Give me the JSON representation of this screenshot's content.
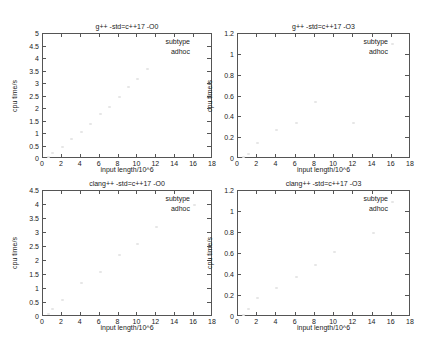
{
  "chart_data": [
    {
      "type": "scatter",
      "title": "g++ -std=c++17 -O0",
      "xlabel": "input length/10^6",
      "ylabel": "cpu time/s",
      "xlim": [
        0,
        18
      ],
      "ylim": [
        0,
        5
      ],
      "xticks": [
        "0",
        "2",
        "4",
        "6",
        "8",
        "10",
        "12",
        "14",
        "16",
        "18"
      ],
      "yticks": [
        "0",
        "0.5",
        "1",
        "1.5",
        "2",
        "2.5",
        "3",
        "3.5",
        "4",
        "4.5",
        "5"
      ],
      "legend": {
        "title": "subtype",
        "entries": [
          "adhoc"
        ],
        "position": "top-right"
      },
      "grid": false,
      "series": [
        {
          "name": "adhoc",
          "x": [
            0.5,
            1,
            2,
            3,
            4,
            5,
            6,
            7,
            8,
            9,
            10,
            11
          ],
          "y": [
            0.1,
            0.25,
            0.5,
            0.8,
            1.1,
            1.4,
            1.8,
            2.1,
            2.5,
            2.9,
            3.2,
            3.6
          ]
        }
      ]
    },
    {
      "type": "scatter",
      "title": "g++ -std=c++17 -O3",
      "xlabel": "input length/10^6",
      "ylabel": "cpu time/s",
      "xlim": [
        0,
        18
      ],
      "ylim": [
        0,
        1.2
      ],
      "xticks": [
        "0",
        "2",
        "4",
        "6",
        "8",
        "10",
        "12",
        "14",
        "16",
        "18"
      ],
      "yticks": [
        "0",
        "0.2",
        "0.4",
        "0.6",
        "0.8",
        "1",
        "1.2"
      ],
      "legend": {
        "title": "subtype",
        "entries": [
          "adhoc"
        ],
        "position": "top-right"
      },
      "grid": false,
      "series": [
        {
          "name": "adhoc",
          "x": [
            0.5,
            1,
            2,
            4,
            6,
            8,
            12,
            16
          ],
          "y": [
            0.02,
            0.05,
            0.15,
            0.28,
            0.35,
            0.55,
            0.35,
            1.1
          ]
        }
      ]
    },
    {
      "type": "scatter",
      "title": "clang++ -std=c++17 -O0",
      "xlabel": "input length/10^6",
      "ylabel": "cpu time/s",
      "xlim": [
        0,
        18
      ],
      "ylim": [
        0,
        4.5
      ],
      "xticks": [
        "0",
        "2",
        "4",
        "6",
        "8",
        "10",
        "12",
        "14",
        "16",
        "18"
      ],
      "yticks": [
        "0",
        "0.5",
        "1",
        "1.5",
        "2",
        "2.5",
        "3",
        "3.5",
        "4",
        "4.5"
      ],
      "legend": {
        "title": "subtype",
        "entries": [
          "adhoc"
        ],
        "position": "top-right"
      },
      "grid": false,
      "series": [
        {
          "name": "adhoc",
          "x": [
            0.5,
            1,
            2,
            4,
            6,
            8,
            10,
            12,
            16
          ],
          "y": [
            0.1,
            0.3,
            0.6,
            1.2,
            1.6,
            2.2,
            2.6,
            3.2,
            4.0
          ]
        }
      ]
    },
    {
      "type": "scatter",
      "title": "clang++ -std=c++17 -O3",
      "xlabel": "input length/10^6",
      "ylabel": "cpu time/s",
      "xlim": [
        0,
        18
      ],
      "ylim": [
        0,
        1.2
      ],
      "xticks": [
        "0",
        "2",
        "4",
        "6",
        "8",
        "10",
        "12",
        "14",
        "16",
        "18"
      ],
      "yticks": [
        "0",
        "0.2",
        "0.4",
        "0.6",
        "0.8",
        "1",
        "1.2"
      ],
      "legend": {
        "title": "subtype",
        "entries": [
          "adhoc"
        ],
        "position": "top-right"
      },
      "grid": false,
      "series": [
        {
          "name": "adhoc",
          "x": [
            0.5,
            1,
            2,
            4,
            6,
            8,
            10,
            14,
            16
          ],
          "y": [
            0.02,
            0.08,
            0.18,
            0.28,
            0.38,
            0.5,
            0.62,
            0.8,
            1.1
          ]
        }
      ]
    }
  ]
}
